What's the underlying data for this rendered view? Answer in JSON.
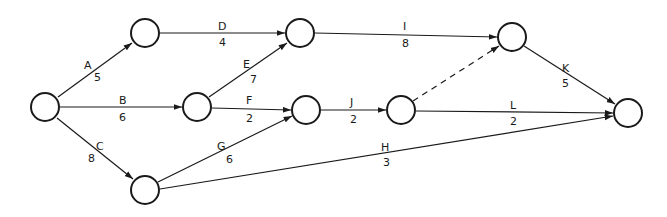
{
  "nodes": [
    {
      "id": "n1",
      "x": 45,
      "y": 107
    },
    {
      "id": "n2",
      "x": 145,
      "y": 33
    },
    {
      "id": "n3",
      "x": 197,
      "y": 107
    },
    {
      "id": "n4",
      "x": 145,
      "y": 190
    },
    {
      "id": "n5",
      "x": 300,
      "y": 33
    },
    {
      "id": "n6",
      "x": 306,
      "y": 110
    },
    {
      "id": "n7",
      "x": 401,
      "y": 110
    },
    {
      "id": "n8",
      "x": 512,
      "y": 37
    },
    {
      "id": "n9",
      "x": 628,
      "y": 113
    }
  ],
  "activities": [
    {
      "name": "A",
      "duration": "5",
      "from": "n1",
      "to": "n2"
    },
    {
      "name": "B",
      "duration": "6",
      "from": "n1",
      "to": "n3"
    },
    {
      "name": "C",
      "duration": "8",
      "from": "n1",
      "to": "n4"
    },
    {
      "name": "D",
      "duration": "4",
      "from": "n2",
      "to": "n5"
    },
    {
      "name": "E",
      "duration": "7",
      "from": "n3",
      "to": "n5"
    },
    {
      "name": "F",
      "duration": "2",
      "from": "n3",
      "to": "n6"
    },
    {
      "name": "G",
      "duration": "6",
      "from": "n4",
      "to": "n6"
    },
    {
      "name": "H",
      "duration": "3",
      "from": "n4",
      "to": "n9"
    },
    {
      "name": "I",
      "duration": "8",
      "from": "n5",
      "to": "n8"
    },
    {
      "name": "J",
      "duration": "2",
      "from": "n6",
      "to": "n7"
    },
    {
      "name": "K",
      "duration": "5",
      "from": "n8",
      "to": "n9"
    },
    {
      "name": "L",
      "duration": "2",
      "from": "n7",
      "to": "n9"
    }
  ],
  "dummy_activities": [
    {
      "from": "n7",
      "to": "n8",
      "style": "dashed"
    }
  ],
  "labels": {
    "A": {
      "name": "A",
      "duration": "5"
    },
    "B": {
      "name": "B",
      "duration": "6"
    },
    "C": {
      "name": "C",
      "duration": "8"
    },
    "D": {
      "name": "D",
      "duration": "4"
    },
    "E": {
      "name": "E",
      "duration": "7"
    },
    "F": {
      "name": "F",
      "duration": "2"
    },
    "G": {
      "name": "G",
      "duration": "6"
    },
    "H": {
      "name": "H",
      "duration": "3"
    },
    "I": {
      "name": "I",
      "duration": "8"
    },
    "J": {
      "name": "J",
      "duration": "2"
    },
    "K": {
      "name": "K",
      "duration": "5"
    },
    "L": {
      "name": "L",
      "duration": "2"
    }
  }
}
